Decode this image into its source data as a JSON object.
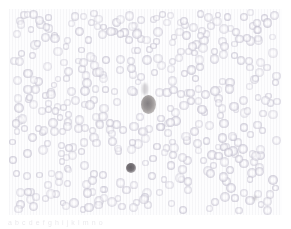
{
  "figure": {
    "name": "peripheral-blood-smear-micrograph",
    "modality": "light-microscopy",
    "stain": "Wright-Giemsa",
    "caption_artifact": "a b c d   e f g h i j k l   m n o",
    "colors": {
      "background": "#ffffff",
      "field": "#fdfdfe",
      "erythrocyte": "#cecbd8",
      "erythrocyte_center": "#ffffff",
      "leukocyte_large": "#8b8686",
      "leukocyte_small": "#6c676c",
      "smudge": "#96929 8"
    },
    "field_geometry": {
      "left": 9,
      "top": 9,
      "width": 273,
      "height": 206
    }
  },
  "chart_data": {
    "type": "scatter",
    "xlabel": "",
    "ylabel": "",
    "xlim": [
      0,
      273
    ],
    "ylim": [
      0,
      206
    ],
    "grid": false,
    "legend": "none",
    "series": [
      {
        "name": "erythrocytes",
        "color": "#cecbd8",
        "count": 430,
        "radius_range": [
          3.2,
          5.0
        ]
      },
      {
        "name": "leukocyte-large",
        "color": "#8b8686",
        "count": 1,
        "points": [
          {
            "x": 139,
            "y": 95,
            "rx": 7.5,
            "ry": 9.5
          }
        ]
      },
      {
        "name": "leukocyte-small",
        "color": "#6c676c",
        "count": 1,
        "points": [
          {
            "x": 122,
            "y": 159,
            "rx": 5.0,
            "ry": 5.0
          }
        ]
      },
      {
        "name": "smudges",
        "color": "#969298",
        "count": 2,
        "points": [
          {
            "x": 136,
            "y": 80,
            "rx": 3.0,
            "ry": 6.0
          },
          {
            "x": 246,
            "y": 189,
            "rx": 1.6,
            "ry": 1.6
          }
        ]
      }
    ]
  }
}
